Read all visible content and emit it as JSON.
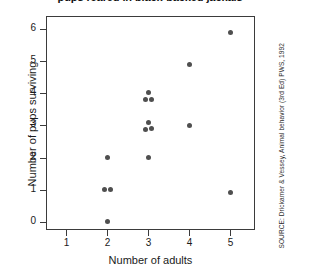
{
  "figure": {
    "title": "pups reared in black-backed jackals",
    "source_note": "SOURCE:  Drickamer & Vessey, Animal behavior (3rd Ed) PWS, 1992",
    "background_color": "#ffffff",
    "point_color": "#4f4f4f",
    "axis_color": "#3b3b3b"
  },
  "chart_data": {
    "type": "scatter",
    "title": "pups reared in black-backed jackals",
    "xlabel": "Number of adults",
    "ylabel": "Number of pups surviving",
    "xlim": [
      0.5,
      5.6
    ],
    "ylim": [
      -0.25,
      6.4
    ],
    "xticks": [
      1,
      2,
      3,
      4,
      5
    ],
    "yticks": [
      0,
      1,
      2,
      3,
      4,
      5,
      6
    ],
    "xticklabels": [
      "1",
      "2",
      "3",
      "4",
      "5"
    ],
    "yticklabels": [
      "0",
      "1",
      "2",
      "3",
      "4",
      "5",
      "6"
    ],
    "grid": false,
    "legend": false,
    "marker": "circle",
    "points": [
      {
        "x": 2.0,
        "y": 0.0
      },
      {
        "x": 1.93,
        "y": 1.0
      },
      {
        "x": 2.08,
        "y": 1.0
      },
      {
        "x": 2.0,
        "y": 2.0
      },
      {
        "x": 3.0,
        "y": 2.0
      },
      {
        "x": 2.94,
        "y": 2.88
      },
      {
        "x": 3.07,
        "y": 2.9
      },
      {
        "x": 3.0,
        "y": 3.1
      },
      {
        "x": 2.94,
        "y": 3.8
      },
      {
        "x": 3.07,
        "y": 3.82
      },
      {
        "x": 3.0,
        "y": 4.02
      },
      {
        "x": 4.0,
        "y": 3.0
      },
      {
        "x": 4.0,
        "y": 4.9
      },
      {
        "x": 5.0,
        "y": 0.9
      },
      {
        "x": 5.0,
        "y": 5.9
      }
    ]
  }
}
